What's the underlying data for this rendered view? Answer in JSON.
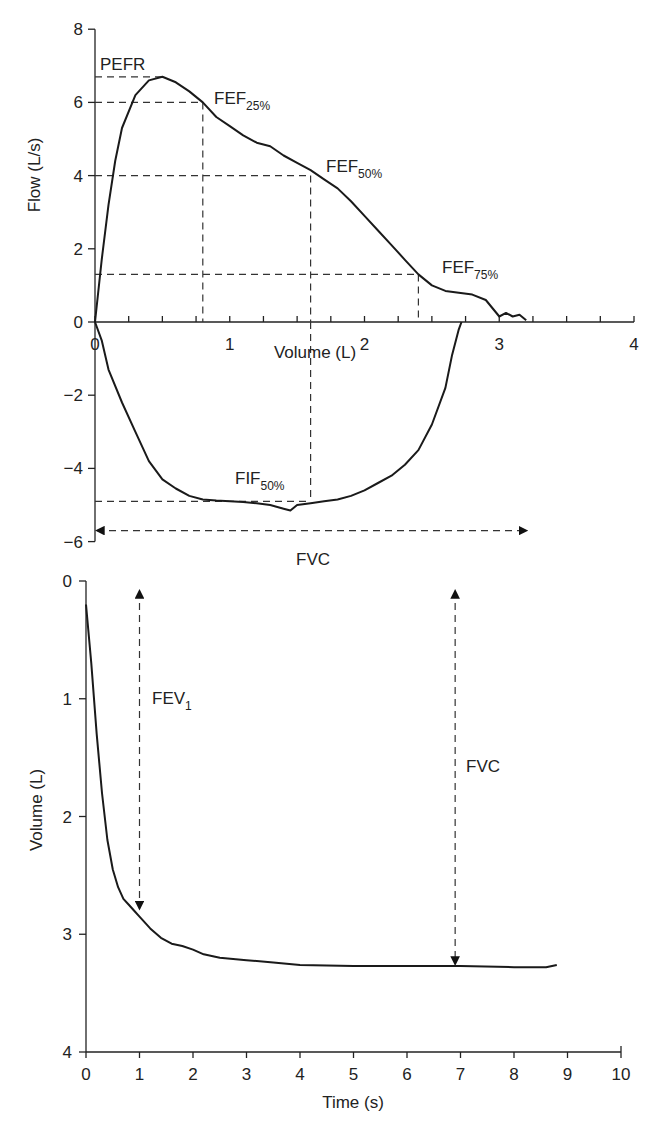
{
  "chart_data": [
    {
      "type": "line",
      "title": "Flow-volume loop",
      "xlabel": "Volume (L)",
      "ylabel": "Flow (L/s)",
      "xlim": [
        0,
        4
      ],
      "ylim": [
        -6,
        8
      ],
      "x_ticks": [
        "0",
        "1",
        "2",
        "3",
        "4"
      ],
      "y_ticks": [
        "8",
        "6",
        "4",
        "2",
        "0",
        "−2",
        "−4",
        "−6"
      ],
      "grid": false,
      "series": [
        {
          "name": "Expiratory limb",
          "x": [
            0,
            0.05,
            0.1,
            0.15,
            0.2,
            0.3,
            0.4,
            0.5,
            0.6,
            0.7,
            0.8,
            0.9,
            1.0,
            1.1,
            1.2,
            1.3,
            1.4,
            1.5,
            1.6,
            1.7,
            1.8,
            1.9,
            2.0,
            2.1,
            2.2,
            2.3,
            2.4,
            2.5,
            2.6,
            2.7,
            2.8,
            2.9,
            3.0,
            3.05,
            3.1,
            3.15,
            3.2
          ],
          "y": [
            0,
            1.7,
            3.2,
            4.4,
            5.3,
            6.2,
            6.6,
            6.7,
            6.55,
            6.3,
            6.0,
            5.6,
            5.35,
            5.1,
            4.9,
            4.8,
            4.55,
            4.35,
            4.15,
            3.9,
            3.65,
            3.3,
            2.9,
            2.5,
            2.1,
            1.7,
            1.3,
            1.0,
            0.85,
            0.8,
            0.75,
            0.6,
            0.15,
            0.25,
            0.15,
            0.2,
            0.05
          ]
        },
        {
          "name": "Inspiratory limb",
          "x": [
            0,
            0.05,
            0.1,
            0.2,
            0.3,
            0.4,
            0.5,
            0.6,
            0.7,
            0.8,
            0.9,
            1.0,
            1.1,
            1.2,
            1.3,
            1.4,
            1.45,
            1.5,
            1.6,
            1.7,
            1.8,
            1.9,
            2.0,
            2.1,
            2.2,
            2.3,
            2.4,
            2.5,
            2.6,
            2.65,
            2.7,
            2.72
          ],
          "y": [
            0,
            -0.5,
            -1.3,
            -2.2,
            -3.0,
            -3.8,
            -4.3,
            -4.55,
            -4.75,
            -4.85,
            -4.88,
            -4.9,
            -4.92,
            -4.95,
            -5.0,
            -5.1,
            -5.15,
            -5.0,
            -4.95,
            -4.9,
            -4.85,
            -4.75,
            -4.6,
            -4.4,
            -4.2,
            -3.9,
            -3.5,
            -2.8,
            -1.8,
            -0.9,
            -0.2,
            0
          ]
        }
      ],
      "annotations": [
        {
          "label": "PEFR",
          "volume": 0.5,
          "flow": 6.7
        },
        {
          "label": "FEF25%",
          "volume": 0.8,
          "flow": 6.0
        },
        {
          "label": "FEF50%",
          "volume": 1.6,
          "flow": 4.0
        },
        {
          "label": "FEF75%",
          "volume": 2.4,
          "flow": 1.3
        },
        {
          "label": "FIF50%",
          "volume": 1.6,
          "flow": -4.9
        },
        {
          "label": "FVC",
          "volume_span": [
            0,
            3.2
          ],
          "flow": -5.7
        }
      ]
    },
    {
      "type": "line",
      "title": "Volume-time curve",
      "xlabel": "Time (s)",
      "ylabel": "Volume (L)",
      "xlim": [
        0,
        10
      ],
      "ylim": [
        4,
        0
      ],
      "x_ticks": [
        "0",
        "1",
        "2",
        "3",
        "4",
        "5",
        "6",
        "7",
        "8",
        "9",
        "10"
      ],
      "y_ticks": [
        "0",
        "1",
        "2",
        "3",
        "4"
      ],
      "grid": false,
      "series": [
        {
          "name": "Volume",
          "x": [
            0,
            0.1,
            0.2,
            0.3,
            0.4,
            0.5,
            0.6,
            0.7,
            0.8,
            0.9,
            1.0,
            1.2,
            1.4,
            1.6,
            1.8,
            2.0,
            2.2,
            2.5,
            3.0,
            3.5,
            4.0,
            5.0,
            6.0,
            7.0,
            8.0,
            8.6,
            8.8
          ],
          "y": [
            0.2,
            0.7,
            1.3,
            1.8,
            2.2,
            2.45,
            2.6,
            2.7,
            2.75,
            2.8,
            2.85,
            2.95,
            3.03,
            3.08,
            3.1,
            3.13,
            3.17,
            3.2,
            3.22,
            3.24,
            3.26,
            3.27,
            3.27,
            3.27,
            3.28,
            3.28,
            3.26
          ]
        }
      ],
      "annotations": [
        {
          "label": "FEV1",
          "time": 1.0,
          "volume_span": [
            0,
            2.8
          ]
        },
        {
          "label": "FVC",
          "time": 6.9,
          "volume_span": [
            0,
            3.27
          ]
        }
      ]
    }
  ],
  "labels": {
    "top_xlabel": "Volume (L)",
    "top_ylabel": "Flow (L/s)",
    "bottom_xlabel": "Time (s)",
    "bottom_ylabel": "Volume (L)",
    "pefr": "PEFR",
    "fef": "FEF",
    "fef25_sub": "25%",
    "fef50_sub": "50%",
    "fef75_sub": "75%",
    "fif": "FIF",
    "fif50_sub": "50%",
    "fvc_top": "FVC",
    "fev": "FEV",
    "fev1_sub": "1",
    "fvc_bottom": "FVC"
  }
}
